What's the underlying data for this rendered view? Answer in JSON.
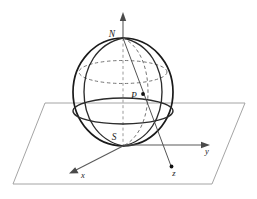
{
  "figure": {
    "background_color": "#ffffff",
    "width": 257,
    "height": 199,
    "colors": {
      "sphere_outline": "#1a1a1a",
      "solid_curve": "#2b2b2b",
      "dashed_curve": "#6e6e6e",
      "plane_edge": "#9a9a9a",
      "axis": "#5a5a5a",
      "projection_ray": "#4a4a4a",
      "label": "#222222",
      "point_marker": "#111111"
    },
    "labels": {
      "north_pole": "N",
      "south_pole": "S",
      "point_on_sphere": "P",
      "axis_x": "x",
      "axis_y": "y",
      "axis_z": "z"
    },
    "geometry": {
      "sphere": {
        "center_x": 123,
        "center_y": 92,
        "radius_x": 50,
        "radius_y": 54
      },
      "plane": {
        "top_left_x": 45,
        "top_left_y": 103,
        "top_right_x": 245,
        "top_right_y": 103,
        "bottom_right_x": 212,
        "bottom_right_y": 184,
        "bottom_left_x": 13,
        "bottom_left_y": 184
      },
      "axes": {
        "vertical_axis_top_y": 14,
        "x_arrow_tip": [
          70,
          172
        ],
        "y_arrow_tip": [
          210,
          145
        ],
        "z_arrow_tip": [
          172,
          167
        ]
      },
      "point_P": [
        143,
        94
      ],
      "point_z": [
        172,
        167
      ]
    }
  }
}
